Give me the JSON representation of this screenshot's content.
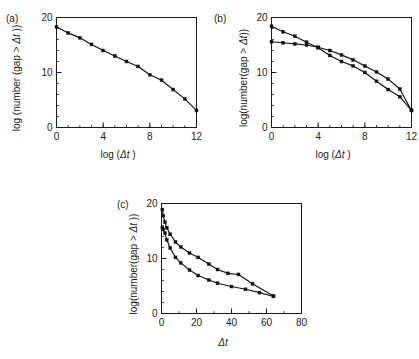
{
  "figure": {
    "background_color": "#ffffff",
    "line_color": "#111111",
    "panel_count": 3
  },
  "panels": {
    "a": {
      "label": "(a)"
    },
    "b": {
      "label": "(b)"
    },
    "c": {
      "label": "(c)"
    }
  },
  "chart_data": [
    {
      "id": "panel-a",
      "type": "line",
      "panel_label": "(a)",
      "title": "",
      "xlabel": "log (Δt)",
      "ylabel": "log (number (gap > Δt))",
      "xlim": [
        0,
        12
      ],
      "ylim": [
        0,
        20
      ],
      "xticks": [
        0,
        4,
        8,
        12
      ],
      "xtick_labels": [
        "0",
        "4",
        "8",
        "12"
      ],
      "xminor_step": 1,
      "yticks": [
        0,
        10,
        20
      ],
      "ytick_labels": [
        "0",
        "10",
        "20"
      ],
      "yminor_step": 2,
      "grid": false,
      "legend": "none",
      "frame": "box",
      "series": [
        {
          "name": "gap distribution",
          "marker": "square",
          "x": [
            0,
            1,
            2,
            3,
            4,
            5,
            6,
            7,
            8,
            9,
            10,
            11,
            12
          ],
          "y": [
            18.3,
            17.2,
            16.3,
            15.1,
            14.0,
            13.0,
            12.0,
            11.1,
            9.6,
            8.6,
            6.9,
            5.2,
            3.1
          ]
        }
      ]
    },
    {
      "id": "panel-b",
      "type": "line",
      "panel_label": "(b)",
      "title": "",
      "xlabel": "log (Δt)",
      "ylabel": "log(number(gap > Δt))",
      "xlim": [
        0,
        12
      ],
      "ylim": [
        0,
        20
      ],
      "xticks": [
        0,
        4,
        8,
        12
      ],
      "xtick_labels": [
        "0",
        "4",
        "8",
        "12"
      ],
      "xminor_step": 1,
      "yticks": [
        0,
        10,
        20
      ],
      "ytick_labels": [
        "0",
        "10",
        "20"
      ],
      "yminor_step": 2,
      "grid": false,
      "legend": "none",
      "frame": "box",
      "series": [
        {
          "name": "steep series",
          "marker": "square",
          "x": [
            0,
            1,
            2,
            3,
            4,
            5,
            6,
            7,
            8,
            9,
            10,
            11,
            12
          ],
          "y": [
            18.4,
            17.4,
            16.6,
            15.5,
            14.5,
            13.1,
            12.0,
            11.2,
            10.0,
            8.4,
            6.9,
            5.6,
            3.1
          ]
        },
        {
          "name": "shallow series",
          "marker": "square",
          "x": [
            0,
            1,
            2,
            3,
            4,
            5,
            6,
            7,
            8,
            9,
            10,
            11,
            12
          ],
          "y": [
            15.6,
            15.4,
            15.2,
            15.0,
            14.6,
            14.0,
            13.2,
            12.3,
            11.2,
            10.1,
            8.8,
            7.0,
            3.1
          ]
        }
      ]
    },
    {
      "id": "panel-c",
      "type": "line",
      "panel_label": "(c)",
      "title": "",
      "xlabel": "Δt",
      "ylabel": "log(number(gap > Δt))",
      "xlim": [
        0,
        80
      ],
      "ylim": [
        0,
        20
      ],
      "xticks": [
        0,
        20,
        40,
        60,
        80
      ],
      "xtick_labels": [
        "0",
        "20",
        "40",
        "60",
        "80"
      ],
      "xminor_step": 10,
      "yticks": [
        0,
        10,
        20
      ],
      "ytick_labels": [
        "0",
        "10",
        "20"
      ],
      "yminor_step": 2,
      "grid": false,
      "legend": "none",
      "frame": "box",
      "series": [
        {
          "name": "upper series",
          "marker": "square",
          "x": [
            0.5,
            1,
            2,
            3,
            5,
            8,
            11,
            16,
            21,
            27,
            32,
            38,
            44,
            52,
            64
          ],
          "y": [
            18.9,
            17.8,
            16.6,
            15.6,
            14.4,
            13.0,
            12.1,
            11.0,
            10.2,
            9.0,
            8.0,
            7.3,
            7.1,
            5.4,
            3.2
          ]
        },
        {
          "name": "lower series",
          "marker": "square",
          "x": [
            0.5,
            1,
            2,
            3,
            5,
            8,
            11,
            16,
            21,
            27,
            32,
            40,
            48,
            56,
            64
          ],
          "y": [
            15.6,
            15.3,
            14.6,
            13.4,
            11.9,
            10.2,
            9.2,
            7.9,
            6.9,
            6.1,
            5.5,
            4.9,
            4.4,
            3.8,
            3.1
          ]
        }
      ]
    }
  ]
}
